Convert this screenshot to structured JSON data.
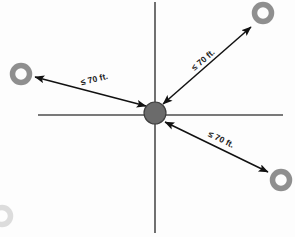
{
  "diagram": {
    "background_color": "#fdfdfd",
    "axis_color": "#4d4d4d",
    "arrow_color": "#111111",
    "ring_color": "#8f8f8f",
    "hub_color": "#6b6b6b",
    "hub": {
      "label": "center-hub",
      "x": 155,
      "y": 113,
      "radius": 11
    },
    "axes": [
      {
        "name": "horizontal-axis",
        "x1": 38,
        "y1": 115,
        "x2": 283,
        "y2": 115
      },
      {
        "name": "vertical-axis",
        "x1": 155,
        "y1": 2,
        "x2": 155,
        "y2": 233
      }
    ],
    "nodes": [
      {
        "name": "node-left",
        "x": 21,
        "y": 74,
        "outer_radius": 11,
        "inner_radius": 6,
        "faint": false
      },
      {
        "name": "node-top-right",
        "x": 263,
        "y": 13,
        "outer_radius": 11,
        "inner_radius": 6,
        "faint": false
      },
      {
        "name": "node-bottom-right",
        "x": 281,
        "y": 180,
        "outer_radius": 11,
        "inner_radius": 6,
        "faint": false
      },
      {
        "name": "node-bottom-left-partial",
        "x": 2,
        "y": 216,
        "outer_radius": 11,
        "inner_radius": 6,
        "faint": true
      }
    ],
    "measures": [
      {
        "name": "measure-left",
        "label": "≤ 70 ft.",
        "from_x": 146,
        "from_y": 106,
        "to_x": 35,
        "to_y": 77,
        "label_x": 95,
        "label_y": 82,
        "label_rotation": -14
      },
      {
        "name": "measure-upper-right",
        "label": "≤ 70 ft.",
        "from_x": 163,
        "from_y": 104,
        "to_x": 251,
        "to_y": 27,
        "label_x": 205,
        "label_y": 62,
        "label_rotation": -41
      },
      {
        "name": "measure-lower-right",
        "label": "≤ 70 ft.",
        "from_x": 165,
        "from_y": 122,
        "to_x": 268,
        "to_y": 172,
        "label_x": 220,
        "label_y": 142,
        "label_rotation": 26
      }
    ]
  }
}
